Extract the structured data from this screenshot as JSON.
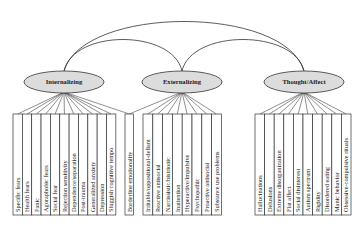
{
  "diagram": {
    "title": "",
    "colors": {
      "ellipse_fill": "#dcdcdc",
      "stroke": "#333333",
      "box_fill": "#ffffff",
      "text": "#222222"
    },
    "factors": [
      {
        "id": "internalizing",
        "label": "Internalizing",
        "items": [
          "Specific fears",
          "Health fears",
          "Panic",
          "Agoraphobic fears",
          "Social fear",
          "Rejection sensitivity",
          "Dependence/separation",
          "Post-trauma",
          "Generalized anxiety",
          "Depression",
          "Sluggish cognitive tempo"
        ]
      },
      {
        "id": "externalizing",
        "label": "Externalizing",
        "items": [
          "Irritable/oppositional-defiant",
          "Reactive antisocial",
          "Narcissistic/histrionic",
          "Inattention",
          "Hyperactive/impulsive",
          "Psychopathic",
          "Proactive antisocial",
          "Substance use problems"
        ]
      },
      {
        "id": "thought-affect",
        "label": "Thought/Affect",
        "items": [
          "Hallucinations",
          "Delusions",
          "Extreme disorganization",
          "Flat affect",
          "Social disinterest",
          "Autism spectrum",
          "Rigidity",
          "Disordered eating",
          "Manic behavior",
          "Obsessive-compulsive rituals"
        ]
      }
    ],
    "shared_items": [
      {
        "label": "Borderline emotionality",
        "loads_on": [
          "internalizing",
          "externalizing"
        ]
      }
    ],
    "correlations": [
      [
        "internalizing",
        "externalizing"
      ],
      [
        "externalizing",
        "thought-affect"
      ],
      [
        "internalizing",
        "thought-affect"
      ]
    ]
  }
}
